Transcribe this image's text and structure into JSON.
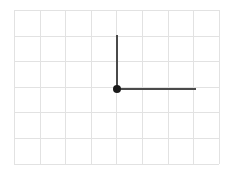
{
  "figure": {
    "background_color": "#ffffff",
    "canvas": {
      "width": 228,
      "height": 171
    }
  },
  "grid": {
    "name": "square-grid",
    "origin_x": 14,
    "origin_y": 10,
    "cell_size": 25.6,
    "columns": 8,
    "rows": 6,
    "line_color": "#e2e2e2",
    "border_color": "#e2e2e2",
    "line_width": 1,
    "x_right": 212.8,
    "y_bottom": 163.6
  },
  "shape": {
    "name": "right-triangle",
    "type": "polygon",
    "stroke_color": "#4a4a4a",
    "stroke_width": 2,
    "fill": "none",
    "vertices": [
      {
        "label": "apex",
        "x": 117,
        "y": 35,
        "grid_col": 4,
        "grid_row": 1
      },
      {
        "label": "right-angle-corner",
        "x": 117,
        "y": 89,
        "grid_col": 4,
        "grid_row": 3
      },
      {
        "label": "right-end",
        "x": 196,
        "y": 89,
        "grid_col": 7,
        "grid_row": 3
      }
    ],
    "points_path": "117,35 117,89 196,89",
    "legs": {
      "vertical_length_cells": 2,
      "horizontal_length_cells": 3
    }
  },
  "marker": {
    "name": "vertex-dot",
    "x": 117,
    "y": 89,
    "radius": 4,
    "color": "#1a1a1a"
  }
}
